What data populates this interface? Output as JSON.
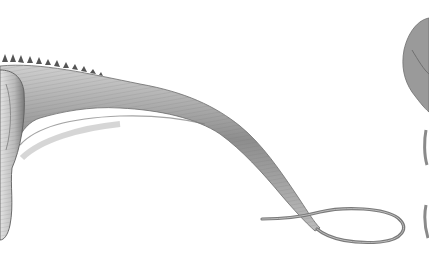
{
  "image": {
    "description": "Pencil illustration of a sauropod dinosaur's hindquarters and long whip-like tail ending in a loop, with part of another figure at the right edge",
    "background": "#ffffff",
    "colors": {
      "body_light": "#d9d9d9",
      "body_mid": "#a6a6a6",
      "body_dark": "#5e5e5e",
      "outline": "#4a4a4a",
      "second_figure": "#8f8f8f"
    },
    "elements": [
      {
        "name": "hindquarters",
        "region": "left edge"
      },
      {
        "name": "dorsal-spikes",
        "region": "top of back"
      },
      {
        "name": "tail",
        "region": "center, curving down to loop"
      },
      {
        "name": "tail-loop",
        "region": "bottom right"
      },
      {
        "name": "second-figure",
        "region": "right edge"
      }
    ]
  }
}
